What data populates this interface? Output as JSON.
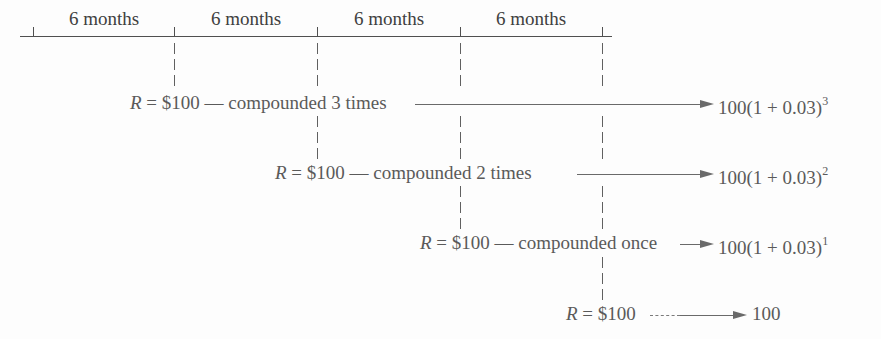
{
  "timeline": {
    "periods": [
      "6 months",
      "6 months",
      "6 months",
      "6 months"
    ]
  },
  "rows": [
    {
      "variable": "R",
      "equals": " = ",
      "amount": "$100",
      "description": " — compounded 3 times",
      "result_base": "100(1 + 0.03)",
      "result_exponent": "3"
    },
    {
      "variable": "R",
      "equals": " = ",
      "amount": "$100",
      "description": " — compounded 2 times",
      "result_base": "100(1 + 0.03)",
      "result_exponent": "2"
    },
    {
      "variable": "R",
      "equals": " = ",
      "amount": "$100",
      "description": " — compounded once",
      "result_base": "100(1 + 0.03)",
      "result_exponent": "1"
    },
    {
      "variable": "R",
      "equals": " = ",
      "amount": "$100",
      "description": "",
      "result_base": "100",
      "result_exponent": ""
    }
  ],
  "colors": {
    "text": "#5a5a5a",
    "lines": "#505050",
    "background": "#fdfdfd"
  }
}
